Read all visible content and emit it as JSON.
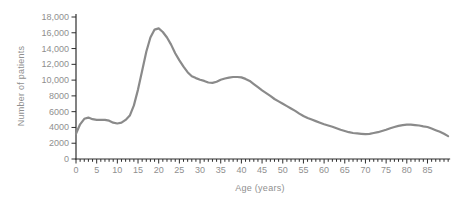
{
  "chart_data": {
    "type": "line",
    "title": "",
    "xlabel": "Age (years)",
    "ylabel": "Number of patients",
    "series_name": "Number of patients by age",
    "xlim": [
      0,
      90
    ],
    "ylim": [
      0,
      18000
    ],
    "grid": false,
    "legend": "none",
    "line_color": "#8a8a8a",
    "axis_color": "#2e2e2e",
    "label_color": "#8f8f8f",
    "x_major_ticks": [
      0,
      5,
      10,
      15,
      20,
      25,
      30,
      35,
      40,
      45,
      50,
      55,
      60,
      65,
      70,
      75,
      80,
      85
    ],
    "x_tick_labels": [
      "0",
      "5",
      "10",
      "15",
      "20",
      "25",
      "30",
      "35",
      "40",
      "45",
      "50",
      "55",
      "60",
      "65",
      "70",
      "75",
      "80",
      "85"
    ],
    "y_ticks": [
      0,
      2000,
      4000,
      6000,
      8000,
      10000,
      12000,
      14000,
      16000,
      18000
    ],
    "y_tick_labels": [
      "0",
      "2000",
      "4000",
      "6000",
      "8000",
      "10,000",
      "12,000",
      "14,000",
      "16,000",
      "18,000"
    ],
    "x": [
      0,
      1,
      2,
      3,
      4,
      5,
      6,
      7,
      8,
      9,
      10,
      11,
      12,
      13,
      14,
      15,
      16,
      17,
      18,
      19,
      20,
      21,
      22,
      23,
      24,
      25,
      26,
      27,
      28,
      29,
      30,
      31,
      32,
      33,
      34,
      35,
      36,
      37,
      38,
      39,
      40,
      41,
      42,
      43,
      44,
      45,
      46,
      47,
      48,
      49,
      50,
      51,
      52,
      53,
      54,
      55,
      56,
      57,
      58,
      59,
      60,
      61,
      62,
      63,
      64,
      65,
      66,
      67,
      68,
      69,
      70,
      71,
      72,
      73,
      74,
      75,
      76,
      77,
      78,
      79,
      80,
      81,
      82,
      83,
      84,
      85,
      86,
      87,
      88,
      89,
      90
    ],
    "values": [
      3200,
      4400,
      5100,
      5250,
      5050,
      4950,
      4950,
      4950,
      4850,
      4600,
      4500,
      4600,
      4950,
      5500,
      6800,
      8800,
      11200,
      13600,
      15400,
      16400,
      16550,
      16100,
      15400,
      14500,
      13400,
      12500,
      11700,
      11000,
      10500,
      10250,
      10050,
      9900,
      9700,
      9650,
      9800,
      10050,
      10200,
      10300,
      10400,
      10400,
      10350,
      10150,
      9900,
      9500,
      9100,
      8700,
      8350,
      8000,
      7600,
      7300,
      7000,
      6700,
      6400,
      6100,
      5750,
      5450,
      5200,
      5000,
      4800,
      4600,
      4400,
      4250,
      4100,
      3900,
      3700,
      3550,
      3400,
      3300,
      3250,
      3200,
      3150,
      3200,
      3300,
      3400,
      3550,
      3700,
      3900,
      4050,
      4200,
      4300,
      4350,
      4350,
      4300,
      4250,
      4150,
      4050,
      3850,
      3650,
      3450,
      3200,
      2900
    ]
  }
}
